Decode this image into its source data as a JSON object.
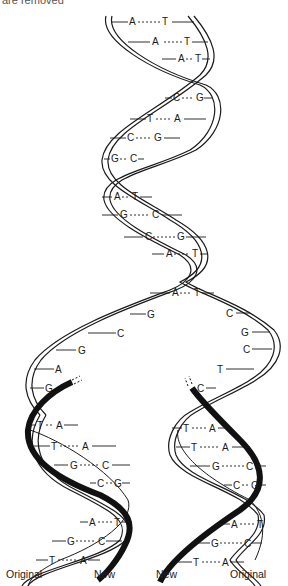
{
  "caption_partial": "are removed",
  "diagram": {
    "parent_pairs": [
      {
        "left": "A",
        "right": "T"
      },
      {
        "left": "A",
        "right": "T"
      },
      {
        "left": "A",
        "right": "T"
      },
      {
        "left": "C",
        "right": "G"
      },
      {
        "left": "T",
        "right": "A"
      },
      {
        "left": "C",
        "right": "G"
      },
      {
        "left": "G",
        "right": "C"
      },
      {
        "left": "A",
        "right": "T"
      },
      {
        "left": "G",
        "right": "C"
      },
      {
        "left": "C",
        "right": "G"
      },
      {
        "left": "A",
        "right": "T"
      },
      {
        "left": "A",
        "right": "T"
      }
    ],
    "fork_left_bases": [
      "G",
      "C",
      "G",
      "A",
      "G"
    ],
    "fork_right_bases": [
      "C",
      "G",
      "C",
      "T",
      "C"
    ],
    "left_daughter_pairs": [
      {
        "left": "T",
        "right": "A"
      },
      {
        "left": "T",
        "right": "A"
      },
      {
        "left": "G",
        "right": "C"
      },
      {
        "left": "C",
        "right": "G"
      },
      {
        "left": "A",
        "right": "T"
      },
      {
        "left": "G",
        "right": "C"
      },
      {
        "left": "T",
        "right": "A"
      }
    ],
    "right_daughter_pairs": [
      {
        "left": "T",
        "right": "A"
      },
      {
        "left": "T",
        "right": "A"
      },
      {
        "left": "G",
        "right": "C"
      },
      {
        "left": "C",
        "right": "G"
      },
      {
        "left": "A",
        "right": "T"
      },
      {
        "left": "G",
        "right": "C"
      },
      {
        "left": "T",
        "right": "A"
      }
    ],
    "labels": {
      "left_original": "Original",
      "left_new": "New",
      "right_new": "New",
      "right_original": "Original"
    },
    "colors": {
      "strand_outline": "#1a1a1a",
      "new_strand_fill": "#111111",
      "background": "#ffffff"
    }
  }
}
